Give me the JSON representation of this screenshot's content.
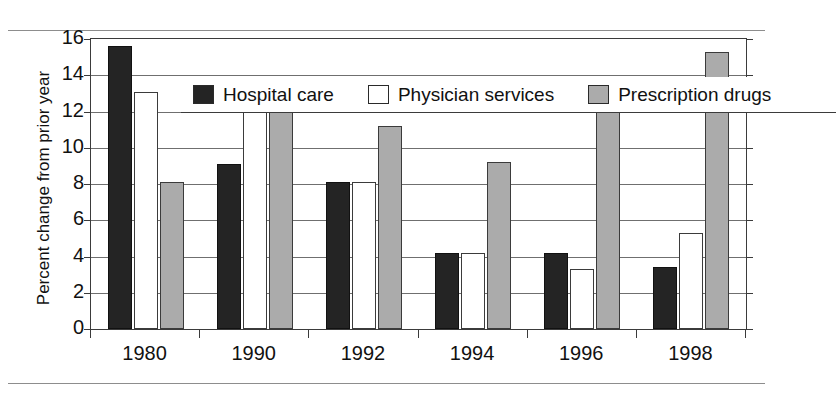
{
  "chart_data": {
    "type": "bar",
    "title": "",
    "subtitle": "",
    "xlabel": "",
    "ylabel": "Percent change from prior year",
    "categories": [
      "1980",
      "1990",
      "1992",
      "1994",
      "1996",
      "1998"
    ],
    "series": [
      {
        "name": "Hospital care",
        "color": "#242424",
        "values": [
          15.6,
          9.1,
          8.1,
          4.2,
          4.2,
          3.4
        ]
      },
      {
        "name": "Physician services",
        "color": "#ffffff",
        "values": [
          13.1,
          12.1,
          8.1,
          4.2,
          3.3,
          5.3
        ]
      },
      {
        "name": "Prescription drugs",
        "color": "#ababab",
        "values": [
          8.1,
          12.1,
          11.2,
          9.2,
          13.3,
          15.3
        ]
      }
    ],
    "ylim": [
      0,
      16
    ],
    "yticks": [
      0,
      2,
      4,
      6,
      8,
      10,
      12,
      14,
      16
    ],
    "ytick_labels": [
      "0",
      "2",
      "4",
      "6",
      "8",
      "10",
      "12",
      "14",
      "16"
    ],
    "grid": true,
    "grid_axis": "y",
    "legend_position": "top-inside"
  },
  "legend": {
    "entries": [
      {
        "label": "Hospital care"
      },
      {
        "label": "Physician services"
      },
      {
        "label": "Prescription drugs"
      }
    ]
  }
}
